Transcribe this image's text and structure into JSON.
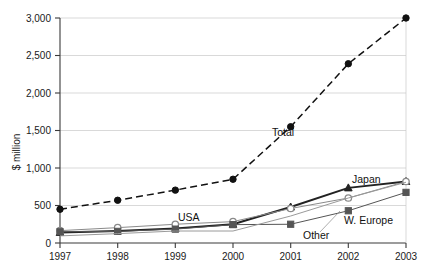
{
  "chart_data": {
    "type": "line",
    "title": "",
    "xlabel": "",
    "ylabel": "$ million",
    "categories": [
      "1997",
      "1998",
      "1999",
      "2000",
      "2001",
      "2002",
      "2003"
    ],
    "x": [
      1997,
      1998,
      1999,
      2000,
      2001,
      2002,
      2003
    ],
    "ylim": [
      0,
      3000
    ],
    "yticks": [
      "0",
      "500",
      "1,000",
      "1,500",
      "2,000",
      "2,500",
      "3,000"
    ],
    "ytick_values": [
      0,
      500,
      1000,
      1500,
      2000,
      2500,
      3000
    ],
    "grid": true,
    "legend_position": "inline-annotations",
    "series": [
      {
        "name": "Total",
        "label": "Total",
        "marker": "circle-filled",
        "line_style": "dashed",
        "color": "#111111",
        "values": [
          450,
          570,
          705,
          850,
          1550,
          2390,
          3000
        ]
      },
      {
        "name": "Japan",
        "label": "Japan",
        "marker": "triangle-filled",
        "line_style": "solid",
        "color": "#222222",
        "values": [
          140,
          160,
          195,
          250,
          480,
          735,
          820
        ]
      },
      {
        "name": "USA",
        "label": "USA",
        "marker": "circle-open",
        "line_style": "solid",
        "color": "#8a8a8a",
        "values": [
          165,
          205,
          250,
          285,
          460,
          600,
          820
        ]
      },
      {
        "name": "W. Europe",
        "label": "W. Europe",
        "marker": "square-filled",
        "line_style": "solid",
        "color": "#555555",
        "values": [
          150,
          155,
          185,
          245,
          250,
          430,
          675
        ]
      },
      {
        "name": "Other",
        "label": "Other",
        "marker": "none",
        "line_style": "solid",
        "color": "#9a9a9a",
        "values": [
          95,
          125,
          160,
          160,
          360,
          600,
          810
        ]
      }
    ]
  },
  "axis": {
    "y_title": "$ million",
    "y_labels": [
      "3,000",
      "2,500",
      "2,000",
      "1,500",
      "1,000",
      "500",
      "0"
    ],
    "x_labels": [
      "1997",
      "1998",
      "1999",
      "2000",
      "2001",
      "2002",
      "2003"
    ]
  },
  "annotations": {
    "total": "Total",
    "japan": "Japan",
    "usa": "USA",
    "w_europe": "W. Europe",
    "other": "Other"
  },
  "colors": {
    "grid": "#c9c9c9",
    "axis": "#3a3a3a",
    "text": "#1a1a1a",
    "total": "#111111",
    "japan": "#222222",
    "usa": "#8a8a8a",
    "w_europe": "#555555",
    "other": "#9a9a9a"
  }
}
